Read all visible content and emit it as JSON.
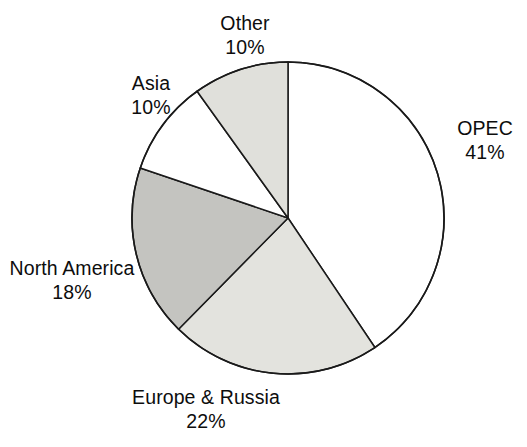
{
  "chart_data": {
    "type": "pie",
    "title": "",
    "subtitle": "",
    "xlabel": "",
    "ylabel": "",
    "legend_position": "none",
    "grid": false,
    "units": "percent",
    "total": 101,
    "start_angle_deg": 0,
    "direction": "clockwise",
    "categories": [
      "OPEC",
      "Europe & Russia",
      "North America",
      "Asia",
      "Other"
    ],
    "values": [
      41,
      22,
      18,
      10,
      10
    ],
    "value_labels": [
      "41%",
      "22%",
      "18%",
      "10%",
      "10%"
    ],
    "slices": [
      {
        "name": "OPEC",
        "value": 41,
        "value_label": "41%",
        "fill": "#ffffff",
        "stroke": "#1a1a1a",
        "label_position": "right"
      },
      {
        "name": "Europe & Russia",
        "value": 22,
        "value_label": "22%",
        "fill": "#e3e3de",
        "stroke": "#1a1a1a",
        "label_position": "bottom"
      },
      {
        "name": "North America",
        "value": 18,
        "value_label": "18%",
        "fill": "#c4c4c0",
        "stroke": "#1a1a1a",
        "label_position": "left"
      },
      {
        "name": "Asia",
        "value": 10,
        "value_label": "10%",
        "fill": "#ffffff",
        "stroke": "#1a1a1a",
        "label_position": "upper-left"
      },
      {
        "name": "Other",
        "value": 10,
        "value_label": "10%",
        "fill": "#e0e0db",
        "stroke": "#1a1a1a",
        "label_position": "top"
      }
    ],
    "colors": {
      "background": "#ffffff",
      "outline": "#1a1a1a",
      "text": "#0d0d0d",
      "fill_white": "#ffffff",
      "fill_light_gray": "#e3e3de",
      "fill_mid_gray": "#c4c4c0"
    },
    "geometry": {
      "center_x": 288,
      "center_y": 218,
      "radius": 156
    }
  }
}
